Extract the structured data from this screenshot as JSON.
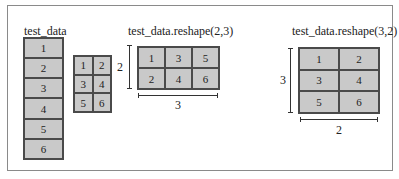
{
  "diagram": {
    "original": {
      "title": "test_data",
      "shape": [
        6,
        1
      ],
      "cells": [
        "1",
        "2",
        "3",
        "4",
        "5",
        "6"
      ]
    },
    "flat_grid": {
      "shape": [
        3,
        2
      ],
      "cells": [
        "1",
        "2",
        "3",
        "4",
        "5",
        "6"
      ]
    },
    "reshape_2_3": {
      "title": "test_data.reshape(2,3)",
      "shape": [
        2,
        3
      ],
      "cells": [
        "1",
        "3",
        "5",
        "2",
        "4",
        "6"
      ],
      "row_dim_label": "2",
      "col_dim_label": "3"
    },
    "reshape_3_2": {
      "title": "test_data.reshape(3,2)",
      "shape": [
        3,
        2
      ],
      "cells": [
        "1",
        "2",
        "3",
        "4",
        "5",
        "6"
      ],
      "row_dim_label": "3",
      "col_dim_label": "2"
    }
  },
  "colors": {
    "cell_fill": "#c9c9c9",
    "grid_line": "#4a4a4a",
    "frame_border": "#8a8a8a"
  }
}
